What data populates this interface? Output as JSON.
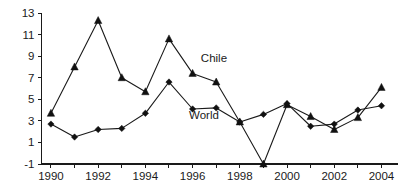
{
  "chart_data": {
    "type": "line",
    "title": "",
    "subtitle": "",
    "xlabel": "",
    "ylabel": "",
    "x": [
      1990,
      1991,
      1992,
      1993,
      1994,
      1995,
      1996,
      1997,
      1998,
      1999,
      2000,
      2001,
      2002,
      2003,
      2004
    ],
    "categories": [
      "1990",
      "1991",
      "1992",
      "1993",
      "1994",
      "1995",
      "1996",
      "1997",
      "1998",
      "1999",
      "2000",
      "2001",
      "2002",
      "2003",
      "2004"
    ],
    "series": [
      {
        "name": "Chile",
        "marker": "triangle",
        "color": "#111111",
        "values": [
          3.7,
          8.0,
          12.3,
          7.0,
          5.7,
          10.6,
          7.4,
          6.6,
          2.9,
          -1.0,
          4.5,
          3.4,
          2.2,
          3.3,
          6.1
        ]
      },
      {
        "name": "World",
        "marker": "diamond",
        "color": "#111111",
        "values": [
          2.7,
          1.5,
          2.2,
          2.3,
          3.7,
          6.6,
          4.1,
          4.2,
          2.9,
          3.6,
          4.6,
          2.5,
          2.7,
          4.0,
          4.4
        ]
      }
    ],
    "xlim": [
      1989.6,
      2004.7
    ],
    "ylim": [
      -1,
      13
    ],
    "y_ticks": [
      -1,
      1,
      3,
      5,
      7,
      9,
      11,
      13
    ],
    "y_tick_labels": [
      "-1",
      "1",
      "3",
      "5",
      "7",
      "9",
      "11",
      "13"
    ],
    "x_ticks": [
      1990,
      1991,
      1992,
      1993,
      1994,
      1995,
      1996,
      1997,
      1998,
      1999,
      2000,
      2001,
      2002,
      2003,
      2004
    ],
    "x_tick_labels_shown": [
      "1990",
      "1992",
      "1994",
      "1996",
      "1998",
      "2000",
      "2002",
      "2004"
    ],
    "grid": false,
    "legend_position": "inline-annotations",
    "annotations": [
      {
        "text": "Chile",
        "x": 1996.35,
        "y": 8.45
      },
      {
        "text": "World",
        "x": 1995.85,
        "y": 3.15
      }
    ]
  }
}
